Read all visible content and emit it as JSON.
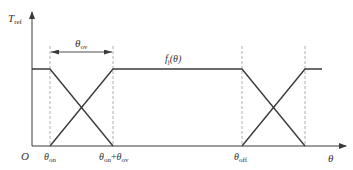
{
  "diagram": {
    "colors": {
      "line": "#3a3a3a",
      "dashed": "#9a9a9a",
      "text": "#333333",
      "background": "#ffffff"
    },
    "axes": {
      "y_label": {
        "main": "T",
        "sub": "ref"
      },
      "x_label": "θ",
      "origin_label": "O"
    },
    "dimension": {
      "label": {
        "main": "θ",
        "sub": "ov"
      }
    },
    "curve_label": {
      "main": "f",
      "sub": "j",
      "arg": "(θ)"
    },
    "x_ticks": [
      {
        "id": "theta-on",
        "main": "θ",
        "sub": "on"
      },
      {
        "id": "theta-on-plus-ov",
        "main1": "θ",
        "sub1": "on",
        "plus": "+",
        "main2": "θ",
        "sub2": "ov"
      },
      {
        "id": "theta-off",
        "main": "θ",
        "sub": "off"
      }
    ]
  }
}
